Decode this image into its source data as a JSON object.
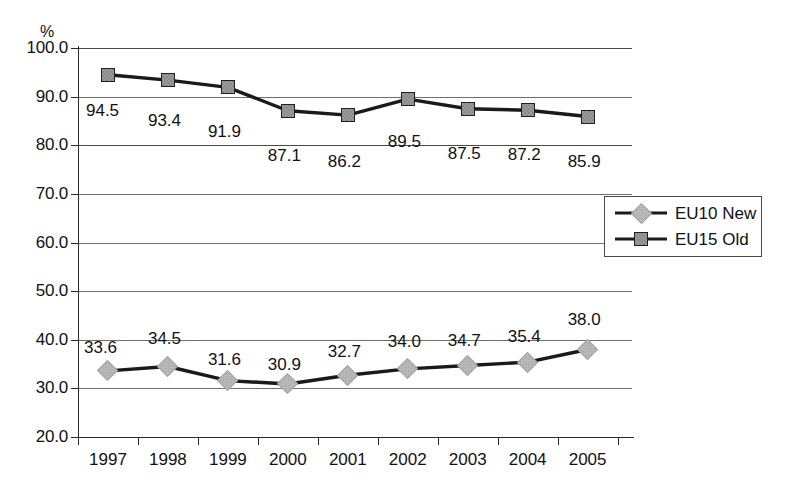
{
  "chart_data": {
    "type": "line",
    "title": "",
    "subtitle": "",
    "xlabel": "",
    "ylabel": "%",
    "ylim": [
      20.0,
      100.0
    ],
    "ystep": 10.0,
    "grid": true,
    "legend_position": "right-middle",
    "categories": [
      "1997",
      "1998",
      "1999",
      "2000",
      "2001",
      "2002",
      "2003",
      "2004",
      "2005"
    ],
    "series": [
      {
        "name": "EU10 New",
        "marker": "diamond",
        "color": "#bdbdbd",
        "line_color": "#1a1a1a",
        "values": [
          33.6,
          34.5,
          31.6,
          30.9,
          32.7,
          34.0,
          34.7,
          35.4,
          38.0
        ],
        "labels": [
          "33.6",
          "34.5",
          "31.6",
          "30.9",
          "32.7",
          "34.0",
          "34.7",
          "35.4",
          "38.0"
        ]
      },
      {
        "name": "EU15 Old",
        "marker": "square",
        "color": "#9a9a9a",
        "line_color": "#1a1a1a",
        "values": [
          94.5,
          93.4,
          91.9,
          87.1,
          86.2,
          89.5,
          87.5,
          87.2,
          85.9
        ],
        "labels": [
          "94.5",
          "93.4",
          "91.9",
          "87.1",
          "86.2",
          "89.5",
          "87.5",
          "87.2",
          "85.9"
        ]
      }
    ],
    "y_tick_labels": [
      "100.0",
      "90.0",
      "80.0",
      "70.0",
      "60.0",
      "50.0",
      "40.0",
      "30.0",
      "20.0"
    ],
    "y_tick_values": [
      100.0,
      90.0,
      80.0,
      70.0,
      60.0,
      50.0,
      40.0,
      30.0,
      20.0
    ]
  },
  "axis": {
    "unit_label": "%"
  },
  "legend": {
    "entries": [
      {
        "label": "EU10 New"
      },
      {
        "label": "EU15 Old"
      }
    ]
  }
}
